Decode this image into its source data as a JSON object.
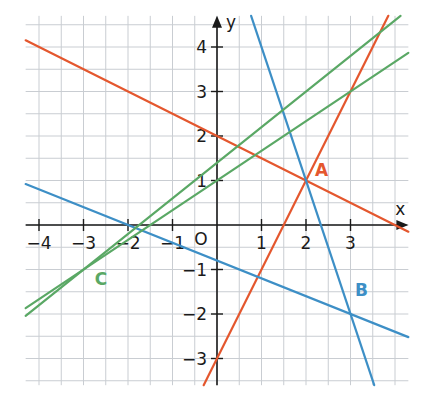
{
  "chart_data": {
    "type": "line",
    "title": "",
    "xlabel": "x",
    "ylabel": "y",
    "xlim": [
      -4.3,
      4.3
    ],
    "ylim": [
      -3.6,
      4.7
    ],
    "grid": true,
    "grid_step": 0.5,
    "origin_label": "O",
    "x_ticks": [
      -4,
      -3,
      -2,
      -1,
      1,
      2,
      3
    ],
    "x_tick_labels": [
      "−4",
      "−3",
      "−2",
      "−1",
      "1",
      "2",
      "3"
    ],
    "y_ticks": [
      -3,
      -2,
      -1,
      1,
      2,
      3,
      4
    ],
    "y_tick_labels": [
      "−3",
      "−2",
      "−1",
      "1",
      "2",
      "3",
      "4"
    ],
    "series": [
      {
        "name": "red line 1",
        "color": "#e4572e",
        "equation": "y = -0.5x + 2",
        "slope": -0.5,
        "intercept": 2
      },
      {
        "name": "red line 2",
        "color": "#e4572e",
        "equation": "y = 2x - 3",
        "slope": 2,
        "intercept": -3
      },
      {
        "name": "blue line 1",
        "color": "#3d8fc6",
        "equation": "y = -0.4x - 0.8",
        "slope": -0.4,
        "intercept": -0.8
      },
      {
        "name": "blue line 2",
        "color": "#3d8fc6",
        "equation": "y = -3x + 7",
        "slope": -3,
        "intercept": 7
      },
      {
        "name": "green line 1",
        "color": "#5aa865",
        "equation": "y = (2/3)x + 1",
        "slope": 0.6667,
        "intercept": 1
      },
      {
        "name": "green line 2",
        "color": "#5aa865",
        "equation": "y = 0.8x + 1.4",
        "slope": 0.8,
        "intercept": 1.4
      }
    ],
    "points": [
      {
        "label": "A",
        "x": 2,
        "y": 1,
        "color": "#e4572e",
        "label_dx": 0.2,
        "label_dy": 0.1
      },
      {
        "label": "B",
        "x": 3,
        "y": -2,
        "color": "#3d8fc6",
        "label_dx": 0.1,
        "label_dy": 0.4
      },
      {
        "label": "C",
        "x": -3,
        "y": -1,
        "color": "#5aa865",
        "label_dx": 0.25,
        "label_dy": -0.35
      }
    ]
  }
}
